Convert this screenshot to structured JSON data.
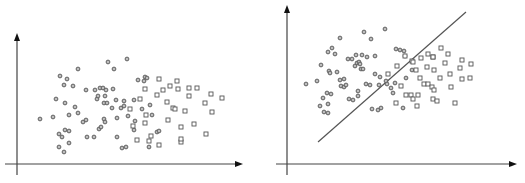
{
  "chart_data": [
    {
      "type": "scatter",
      "title": "",
      "xlabel": "",
      "ylabel": "",
      "grid": false,
      "legend": null,
      "panel": "left",
      "series": [
        {
          "name": "class-circle",
          "marker": "circle",
          "points": [
            [
              40,
              119
            ],
            [
              53,
              117
            ],
            [
              56,
              99
            ],
            [
              59,
              147
            ],
            [
              59,
              134
            ],
            [
              60,
              76
            ],
            [
              62,
              137
            ],
            [
              64,
              85
            ],
            [
              64,
              152
            ],
            [
              65,
              103
            ],
            [
              65,
              130
            ],
            [
              67,
              79
            ],
            [
              69,
              115
            ],
            [
              69,
              131
            ],
            [
              69,
              143
            ],
            [
              73,
              86
            ],
            [
              75,
              107
            ],
            [
              78,
              69
            ],
            [
              78,
              113
            ],
            [
              83,
              122
            ],
            [
              86,
              90
            ],
            [
              86,
              120
            ],
            [
              87,
              137
            ],
            [
              94,
              137
            ],
            [
              95,
              90
            ],
            [
              97,
              99
            ],
            [
              98,
              96
            ],
            [
              99,
              129
            ],
            [
              100,
              88
            ],
            [
              101,
              127
            ],
            [
              103,
              88
            ],
            [
              104,
              119
            ],
            [
              105,
              96
            ],
            [
              106,
              90
            ],
            [
              104,
              103
            ],
            [
              105,
              122
            ],
            [
              107,
              103
            ],
            [
              108,
              62
            ],
            [
              112,
              108
            ],
            [
              113,
              89
            ],
            [
              114,
              69
            ],
            [
              116,
              100
            ],
            [
              117,
              137
            ],
            [
              117,
              118
            ],
            [
              121,
              108
            ],
            [
              122,
              148
            ],
            [
              124,
              106
            ],
            [
              124,
              101
            ],
            [
              126,
              147
            ],
            [
              127,
              59
            ],
            [
              128,
              116
            ],
            [
              134,
              100
            ],
            [
              134,
              130
            ],
            [
              135,
              121
            ],
            [
              138,
              80
            ],
            [
              142,
              109
            ],
            [
              144,
              81
            ],
            [
              145,
              77
            ],
            [
              147,
              78
            ],
            [
              149,
              147
            ],
            [
              150,
              105
            ],
            [
              152,
              115
            ],
            [
              157,
              132
            ],
            [
              159,
              131
            ]
          ]
        },
        {
          "name": "class-square",
          "marker": "square",
          "points": [
            [
              130,
              109
            ],
            [
              133,
              126
            ],
            [
              137,
              140
            ],
            [
              140,
              99
            ],
            [
              145,
              123
            ],
            [
              145,
              89
            ],
            [
              146,
              115
            ],
            [
              149,
              141
            ],
            [
              151,
              136
            ],
            [
              157,
              95
            ],
            [
              159,
              79
            ],
            [
              159,
              145
            ],
            [
              163,
              90
            ],
            [
              167,
              102
            ],
            [
              168,
              120
            ],
            [
              170,
              86
            ],
            [
              173,
              108
            ],
            [
              175,
              109
            ],
            [
              177,
              81
            ],
            [
              178,
              89
            ],
            [
              181,
              127
            ],
            [
              181,
              142
            ],
            [
              181,
              139
            ],
            [
              185,
              111
            ],
            [
              189,
              96
            ],
            [
              189,
              88
            ],
            [
              194,
              124
            ],
            [
              197,
              88
            ],
            [
              205,
              103
            ],
            [
              206,
              134
            ],
            [
              211,
              94
            ],
            [
              212,
              112
            ],
            [
              222,
              98
            ]
          ]
        }
      ],
      "xlim": [
        0,
        1
      ],
      "ylim": [
        0,
        1
      ]
    },
    {
      "type": "scatter",
      "title": "",
      "xlabel": "",
      "ylabel": "",
      "grid": false,
      "legend": null,
      "panel": "right",
      "separator_line": {
        "from": [
          318,
          142
        ],
        "to": [
          466,
          12
        ]
      },
      "series": [
        {
          "name": "class-circle",
          "marker": "circle",
          "points": [
            [
              306,
              84
            ],
            [
              317,
              81
            ],
            [
              320,
              106
            ],
            [
              321,
              65
            ],
            [
              323,
              98
            ],
            [
              324,
              112
            ],
            [
              327,
              93
            ],
            [
              328,
              104
            ],
            [
              328,
              113
            ],
            [
              328,
              52
            ],
            [
              329,
              71
            ],
            [
              330,
              73
            ],
            [
              331,
              94
            ],
            [
              332,
              48
            ],
            [
              335,
              54
            ],
            [
              337,
              72
            ],
            [
              340,
              80
            ],
            [
              340,
              38
            ],
            [
              341,
              86
            ],
            [
              344,
              79
            ],
            [
              344,
              87
            ],
            [
              346,
              85
            ],
            [
              348,
              59
            ],
            [
              349,
              99
            ],
            [
              352,
              59
            ],
            [
              353,
              100
            ],
            [
              355,
              66
            ],
            [
              356,
              55
            ],
            [
              357,
              63
            ],
            [
              358,
              96
            ],
            [
              358,
              91
            ],
            [
              359,
              62
            ],
            [
              360,
              64
            ],
            [
              361,
              69
            ],
            [
              362,
              55
            ],
            [
              363,
              69
            ],
            [
              364,
              32
            ],
            [
              366,
              84
            ],
            [
              367,
              57
            ],
            [
              370,
              85
            ],
            [
              371,
              39
            ],
            [
              372,
              109
            ],
            [
              375,
              56
            ],
            [
              375,
              74
            ],
            [
              378,
              110
            ],
            [
              379,
              85
            ],
            [
              380,
              77
            ],
            [
              381,
              108
            ],
            [
              385,
              29
            ],
            [
              386,
              81
            ],
            [
              387,
              84
            ],
            [
              391,
              88
            ],
            [
              393,
              93
            ],
            [
              395,
              83
            ],
            [
              396,
              49
            ],
            [
              400,
              50
            ],
            [
              403,
              108
            ],
            [
              404,
              51
            ],
            [
              405,
              56
            ],
            [
              406,
              78
            ],
            [
              412,
              70
            ]
          ]
        },
        {
          "name": "class-square",
          "marker": "square",
          "points": [
            [
              388,
              74
            ],
            [
              397,
              66
            ],
            [
              396,
              103
            ],
            [
              401,
              86
            ],
            [
              405,
              56
            ],
            [
              406,
              95
            ],
            [
              411,
              95
            ],
            [
              412,
              61
            ],
            [
              413,
              99
            ],
            [
              413,
              62
            ],
            [
              416,
              70
            ],
            [
              417,
              106
            ],
            [
              418,
              95
            ],
            [
              420,
              78
            ],
            [
              421,
              58
            ],
            [
              424,
              84
            ],
            [
              427,
              67
            ],
            [
              428,
              54
            ],
            [
              428,
              84
            ],
            [
              432,
              87
            ],
            [
              433,
              57
            ],
            [
              434,
              90
            ],
            [
              440,
              78
            ],
            [
              434,
              70
            ],
            [
              433,
              57
            ],
            [
              433,
              99
            ],
            [
              437,
              101
            ],
            [
              441,
              48
            ],
            [
              445,
              63
            ],
            [
              448,
              54
            ],
            [
              451,
              87
            ],
            [
              450,
              74
            ],
            [
              455,
              103
            ],
            [
              460,
              68
            ],
            [
              462,
              60
            ],
            [
              462,
              79
            ],
            [
              470,
              78
            ],
            [
              471,
              64
            ]
          ]
        }
      ],
      "xlim": [
        0,
        1
      ],
      "ylim": [
        0,
        1
      ]
    }
  ]
}
